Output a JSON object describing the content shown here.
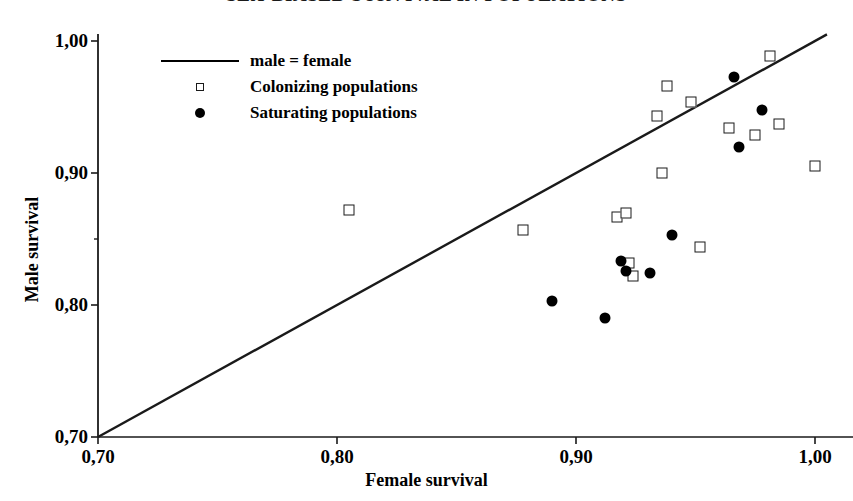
{
  "chart_data": {
    "type": "scatter",
    "title": "SEX-BIASED SURVIVAL IN POPULATIONS",
    "xlabel": "Female survival",
    "ylabel": "Male survival",
    "xlim": [
      0.7,
      1.005
    ],
    "ylim": [
      0.7,
      1.005
    ],
    "xticks": [
      0.7,
      0.8,
      0.9,
      1.0
    ],
    "yticks": [
      0.7,
      0.8,
      0.9,
      1.0
    ],
    "xtick_labels": [
      "0,70",
      "0,80",
      "0,90",
      "1,00"
    ],
    "ytick_labels": [
      "0,70",
      "0,80",
      "0,90",
      "1,00"
    ],
    "grid": false,
    "legend_position": "upper-left",
    "reference_line": {
      "label": "male = female",
      "from": [
        0.7,
        0.7
      ],
      "to": [
        1.005,
        1.005
      ]
    },
    "series": [
      {
        "name": "Colonizing populations",
        "marker": "open-square",
        "color": "#1a1a1a",
        "points": [
          [
            0.805,
            0.872
          ],
          [
            0.878,
            0.857
          ],
          [
            0.917,
            0.867
          ],
          [
            0.921,
            0.87
          ],
          [
            0.922,
            0.832
          ],
          [
            0.924,
            0.822
          ],
          [
            0.934,
            0.943
          ],
          [
            0.936,
            0.9
          ],
          [
            0.938,
            0.966
          ],
          [
            0.948,
            0.954
          ],
          [
            0.952,
            0.844
          ],
          [
            0.964,
            0.934
          ],
          [
            0.975,
            0.929
          ],
          [
            0.981,
            0.989
          ],
          [
            0.985,
            0.937
          ],
          [
            1.0,
            0.905
          ]
        ]
      },
      {
        "name": "Saturating populations",
        "marker": "filled-circle",
        "color": "#000000",
        "points": [
          [
            0.89,
            0.803
          ],
          [
            0.912,
            0.79
          ],
          [
            0.919,
            0.833
          ],
          [
            0.921,
            0.826
          ],
          [
            0.931,
            0.824
          ],
          [
            0.94,
            0.853
          ],
          [
            0.966,
            0.973
          ],
          [
            0.968,
            0.92
          ],
          [
            0.978,
            0.948
          ]
        ]
      }
    ]
  },
  "axes": {
    "x_title": "Female survival",
    "y_title": "Male survival",
    "y_origin_label": "0,70"
  },
  "legend": {
    "entries": [
      {
        "marker": "line",
        "label": "male = female"
      },
      {
        "marker": "open-square",
        "label": "Colonizing populations"
      },
      {
        "marker": "filled-circle",
        "label": "Saturating populations"
      }
    ]
  }
}
